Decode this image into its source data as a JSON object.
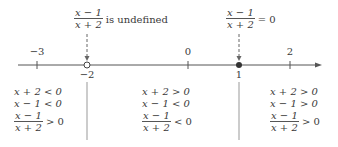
{
  "annotations": {
    "undefined": {
      "num": "x − 1",
      "den": "x + 2",
      "text": "is undefined"
    },
    "zero": {
      "num": "x − 1",
      "den": "x + 2",
      "text": "= 0"
    }
  },
  "axis": {
    "ticks": [
      {
        "label": "−3",
        "x": 37,
        "above": true
      },
      {
        "label": "−2",
        "x": 87,
        "above": false
      },
      {
        "label": "0",
        "x": 188,
        "above": true
      },
      {
        "label": "1",
        "x": 239,
        "above": false
      },
      {
        "label": "2",
        "x": 290,
        "above": true
      }
    ]
  },
  "intervals": [
    {
      "l1": "x + 2 < 0",
      "l2": "x − 1 < 0",
      "frac_num": "x − 1",
      "frac_den": "x + 2",
      "rel": "> 0"
    },
    {
      "l1": "x + 2 > 0",
      "l2": "x − 1 < 0",
      "frac_num": "x − 1",
      "frac_den": "x + 2",
      "rel": "< 0"
    },
    {
      "l1": "x + 2 > 0",
      "l2": "x − 1 > 0",
      "frac_num": "x − 1",
      "frac_den": "x + 2",
      "rel": "> 0"
    }
  ]
}
